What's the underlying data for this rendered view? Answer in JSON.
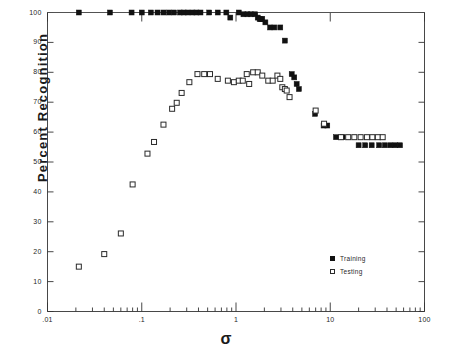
{
  "chart_data": {
    "type": "scatter",
    "title": "",
    "xlabel": "σ",
    "ylabel": "Percent Recognition",
    "xscale": "log",
    "yscale": "linear",
    "xlim": [
      0.01,
      100
    ],
    "ylim": [
      0,
      100
    ],
    "xticks": [
      0.01,
      0.1,
      1,
      10,
      100
    ],
    "xtick_labels": [
      ".01",
      ".1",
      "1",
      "10",
      "100"
    ],
    "yticks": [
      0,
      10,
      20,
      30,
      40,
      50,
      60,
      70,
      80,
      90,
      100
    ],
    "ytick_labels": [
      "0",
      "10",
      "20",
      "30",
      "40",
      "50",
      "60",
      "70",
      "80",
      "90",
      "100"
    ],
    "grid": false,
    "legend_position": "lower-right-inside",
    "series": [
      {
        "name": "Training",
        "marker": "filled-square",
        "color": "#111111",
        "points": [
          [
            0.0215,
            100.0
          ],
          [
            0.046,
            100.0
          ],
          [
            0.078,
            100.0
          ],
          [
            0.1,
            100.0
          ],
          [
            0.125,
            100.0
          ],
          [
            0.147,
            100.0
          ],
          [
            0.17,
            100.0
          ],
          [
            0.195,
            100.0
          ],
          [
            0.22,
            100.0
          ],
          [
            0.255,
            100.0
          ],
          [
            0.28,
            100.0
          ],
          [
            0.31,
            100.0
          ],
          [
            0.345,
            100.0
          ],
          [
            0.38,
            100.0
          ],
          [
            0.42,
            100.0
          ],
          [
            0.52,
            100.0
          ],
          [
            0.64,
            100.0
          ],
          [
            0.79,
            100.0
          ],
          [
            0.87,
            98.3
          ],
          [
            1.07,
            100.0
          ],
          [
            1.2,
            99.4
          ],
          [
            1.32,
            99.4
          ],
          [
            1.45,
            99.4
          ],
          [
            1.6,
            99.4
          ],
          [
            1.7,
            98.3
          ],
          [
            1.78,
            97.8
          ],
          [
            1.84,
            97.8
          ],
          [
            1.9,
            97.8
          ],
          [
            2.05,
            96.7
          ],
          [
            2.3,
            95.0
          ],
          [
            2.55,
            95.0
          ],
          [
            2.95,
            95.0
          ],
          [
            3.3,
            90.6
          ],
          [
            3.9,
            79.4
          ],
          [
            4.15,
            78.3
          ],
          [
            4.4,
            76.1
          ],
          [
            4.65,
            74.4
          ],
          [
            6.9,
            66.1
          ],
          [
            8.5,
            62.2
          ],
          [
            9.3,
            62.2
          ],
          [
            11.5,
            58.3
          ],
          [
            13.5,
            58.3
          ],
          [
            20.0,
            55.6
          ],
          [
            23.5,
            55.6
          ],
          [
            27.5,
            55.6
          ],
          [
            33.0,
            55.6
          ],
          [
            38.0,
            55.6
          ],
          [
            43.5,
            55.6
          ],
          [
            49.0,
            55.6
          ],
          [
            55.0,
            55.6
          ]
        ]
      },
      {
        "name": "Testing",
        "marker": "open-square",
        "color": "#2a2a2a",
        "points": [
          [
            0.0215,
            15.0
          ],
          [
            0.04,
            19.2
          ],
          [
            0.06,
            26.1
          ],
          [
            0.08,
            42.5
          ],
          [
            0.115,
            52.8
          ],
          [
            0.135,
            56.7
          ],
          [
            0.17,
            62.5
          ],
          [
            0.21,
            67.8
          ],
          [
            0.235,
            69.8
          ],
          [
            0.265,
            73.1
          ],
          [
            0.32,
            76.7
          ],
          [
            0.39,
            79.4
          ],
          [
            0.46,
            79.4
          ],
          [
            0.53,
            79.4
          ],
          [
            0.64,
            77.8
          ],
          [
            0.82,
            77.2
          ],
          [
            0.95,
            76.7
          ],
          [
            1.07,
            77.2
          ],
          [
            1.18,
            77.2
          ],
          [
            1.3,
            79.4
          ],
          [
            1.38,
            76.1
          ],
          [
            1.52,
            80.0
          ],
          [
            1.7,
            80.0
          ],
          [
            1.9,
            78.9
          ],
          [
            2.2,
            77.2
          ],
          [
            2.45,
            77.2
          ],
          [
            2.75,
            78.9
          ],
          [
            2.95,
            77.8
          ],
          [
            3.1,
            75.0
          ],
          [
            3.3,
            74.4
          ],
          [
            3.45,
            73.9
          ],
          [
            3.7,
            71.7
          ],
          [
            7.0,
            67.2
          ],
          [
            8.6,
            62.8
          ],
          [
            13.0,
            58.3
          ],
          [
            15.5,
            58.3
          ],
          [
            18.0,
            58.3
          ],
          [
            21.0,
            58.3
          ],
          [
            24.5,
            58.3
          ],
          [
            28.0,
            58.3
          ],
          [
            32.0,
            58.3
          ],
          [
            36.0,
            58.3
          ]
        ]
      }
    ]
  },
  "legend": {
    "entries": [
      {
        "label": "Training",
        "marker": "filled-square"
      },
      {
        "label": "Testing",
        "marker": "open-square"
      }
    ]
  },
  "axes": {
    "y_title": "Percent Recognition",
    "x_title": "σ"
  }
}
